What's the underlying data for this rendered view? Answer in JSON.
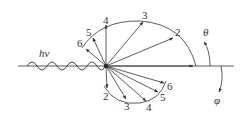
{
  "diagram": {
    "incident_label": "hν",
    "theta_label": "θ",
    "phi_label": "φ",
    "photon_arrows": [
      {
        "label": "2"
      },
      {
        "label": "3"
      },
      {
        "label": "4"
      },
      {
        "label": "5"
      },
      {
        "label": "6"
      }
    ],
    "electron_arrows": [
      {
        "label": "2"
      },
      {
        "label": "3"
      },
      {
        "label": "4"
      },
      {
        "label": "5"
      },
      {
        "label": "6"
      }
    ],
    "colors": {
      "line": "#333333",
      "background": "#ffffff"
    }
  }
}
